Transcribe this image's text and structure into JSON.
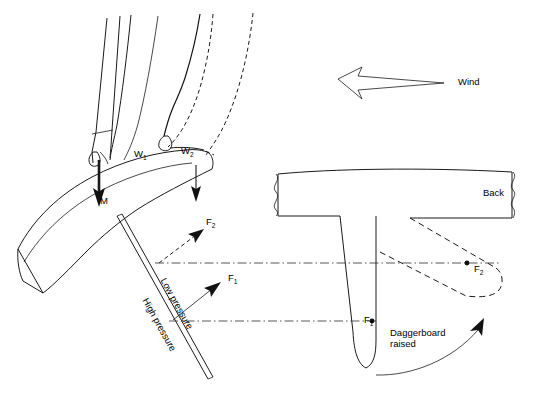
{
  "figure": {
    "background_color": "#ffffff",
    "ink_color": "#1a1a1a"
  },
  "labels": {
    "wind": "Wind",
    "mast_force": "M",
    "sail_force_1": "W",
    "sail_force_1_sub": "1",
    "sail_force_2": "W",
    "sail_force_2_sub": "2",
    "force_1": "F",
    "force_1_sub": "1",
    "force_2": "F",
    "force_2_sub": "2",
    "force_1_back": "F",
    "force_1_back_sub": "1",
    "force_2_back": "F",
    "force_2_back_sub": "2",
    "low_pressure": "Low pressure",
    "high_pressure": "High pressure",
    "back_view": "Back",
    "daggerboard_raised_line1": "Daggerboard",
    "daggerboard_raised_line2": "raised"
  },
  "views": {
    "plan": {
      "name": "plan-view-board-and-sail",
      "elements": [
        "mast",
        "sail",
        "sail-alternate-dashed",
        "hull-outline",
        "daggerboard-plan",
        "force-arrows"
      ]
    },
    "back": {
      "name": "back-view-hull-section",
      "elements": [
        "hull-deck",
        "daggerboard-down",
        "daggerboard-raised-dashed",
        "break-line-left",
        "break-line-right",
        "rotation-arrow"
      ]
    }
  },
  "annotations": {
    "centerlines": [
      {
        "name": "centerline-f2",
        "y": 262
      },
      {
        "name": "centerline-f1",
        "y": 320
      }
    ]
  }
}
